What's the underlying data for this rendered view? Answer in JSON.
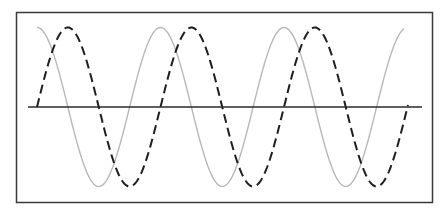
{
  "diagram": {
    "title": "",
    "colors": {
      "frame": "#3a3a3a",
      "axis": "#2a2a2a",
      "wave_solid": "#b8b8b8",
      "wave_dashed": "#1e1e1e",
      "background": "#ffffff"
    },
    "waves": [
      {
        "name": "solid-gray-wave",
        "style": "solid",
        "cycles": 3.0,
        "phase_cycles": 0.0
      },
      {
        "name": "dashed-black-wave",
        "style": "dashed",
        "cycles": 3.0,
        "phase_cycles": 0.25
      }
    ]
  }
}
